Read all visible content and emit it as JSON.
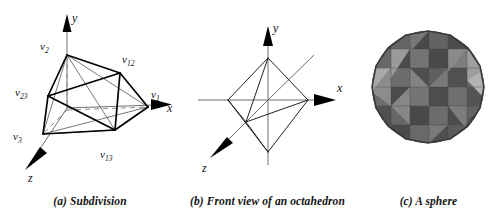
{
  "figure": {
    "background_color": "#ffffff",
    "panel_count": 3
  },
  "panels": [
    {
      "id": "a",
      "caption": "(a) Subdivision",
      "type": "octahedron-subdivision-3d",
      "axes": [
        {
          "name": "y",
          "label": "y",
          "direction": "up"
        },
        {
          "name": "x",
          "label": "x",
          "direction": "right"
        },
        {
          "name": "z",
          "label": "z",
          "direction": "down-left"
        }
      ],
      "vertex_labels": [
        {
          "id": "v2",
          "base": "v",
          "sub": "2"
        },
        {
          "id": "v12",
          "base": "v",
          "sub": "12"
        },
        {
          "id": "v23",
          "base": "v",
          "sub": "23"
        },
        {
          "id": "v1",
          "base": "v",
          "sub": "1"
        },
        {
          "id": "v3",
          "base": "v",
          "sub": "3"
        },
        {
          "id": "v13",
          "base": "v",
          "sub": "13"
        }
      ]
    },
    {
      "id": "b",
      "caption": "(b) Front view of an octahedron",
      "type": "octahedron-front-view",
      "axes": [
        {
          "name": "y",
          "label": "y",
          "direction": "up"
        },
        {
          "name": "x",
          "label": "x",
          "direction": "right"
        },
        {
          "name": "z",
          "label": "z",
          "direction": "down-left"
        }
      ],
      "vertex_labels": []
    },
    {
      "id": "c",
      "caption": "(c) A sphere",
      "type": "faceted-sphere",
      "axes": [],
      "vertex_labels": [],
      "sphere": {
        "facet_colors": [
          "#6f6f6f",
          "#595959",
          "#7d7d7d",
          "#4c4c4c",
          "#8e8e8e",
          "#a5a5a5",
          "#636363",
          "#545454",
          "#747474",
          "#bdbdbd"
        ],
        "outline_color": "#3a3a3a",
        "center_x": 73,
        "center_y": 87,
        "radius": 56
      }
    }
  ]
}
